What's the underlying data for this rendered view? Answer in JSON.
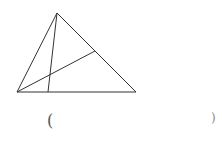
{
  "diagram": {
    "type": "triangle-with-cevians",
    "stroke_color": "#333333",
    "points": {
      "A": [
        57,
        13
      ],
      "B": [
        17,
        92
      ],
      "C": [
        136,
        92
      ],
      "D": [
        48,
        92
      ],
      "E": [
        95,
        51
      ]
    },
    "segments": [
      {
        "from": "A",
        "to": "B"
      },
      {
        "from": "A",
        "to": "C"
      },
      {
        "from": "B",
        "to": "C"
      },
      {
        "from": "A",
        "to": "D"
      },
      {
        "from": "B",
        "to": "E"
      }
    ]
  },
  "answer_blank": {
    "open": "(",
    "close": ")"
  }
}
